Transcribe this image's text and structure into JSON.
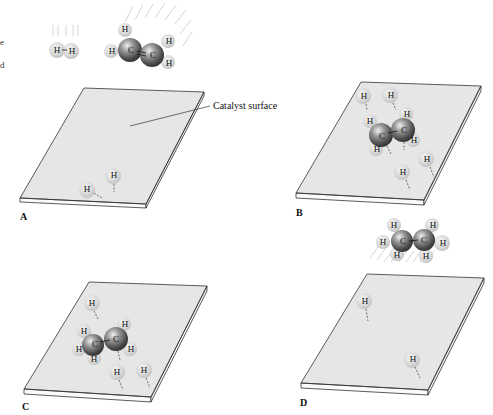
{
  "diagram": {
    "callout_label": "Catalyst surface",
    "left_edge_fragments": [
      "e",
      "d"
    ],
    "atom_labels": {
      "hydrogen": "H",
      "carbon": "C"
    },
    "colors": {
      "surface_fill": "#e6e6e6",
      "surface_edge": "#333333",
      "hydrogen_atom": "#d8d8d8",
      "carbon_atom": "#7a7a7a",
      "motion_lines": "#cfcfcf"
    },
    "free_molecules": [
      {
        "name": "H2",
        "formula_display": "H–H",
        "position": "top-left, above panel A"
      },
      {
        "name": "ethylene",
        "formula": "H2C=CH2",
        "position": "top, above panel A"
      },
      {
        "name": "ethane",
        "formula": "H3C–CH3",
        "position": "above panel D, leaving surface"
      }
    ],
    "panels": [
      {
        "label": "A",
        "description": "H atoms adsorbed on catalyst surface",
        "adsorbed_h": 2
      },
      {
        "label": "B",
        "description": "Ethylene adsorbed alongside H atoms",
        "adsorbed_h": 4
      },
      {
        "label": "C",
        "description": "One H added to ethylene (ethyl intermediate)",
        "adsorbed_h": 3
      },
      {
        "label": "D",
        "description": "Ethane released from surface",
        "adsorbed_h": 2
      }
    ]
  }
}
